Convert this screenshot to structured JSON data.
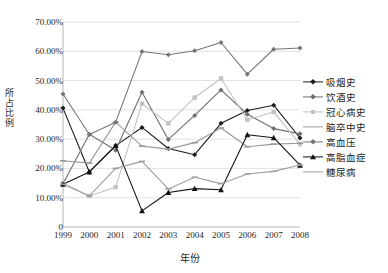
{
  "chart_data": {
    "type": "line",
    "title": "",
    "xlabel": "年份",
    "ylabel": "所占比例",
    "x": [
      1999,
      2000,
      2001,
      2002,
      2003,
      2004,
      2005,
      2006,
      2007,
      2008
    ],
    "xtick_labels": [
      "1999",
      "2000",
      "2001",
      "2002",
      "2003",
      "2004",
      "2005",
      "2006",
      "2007",
      "2008"
    ],
    "ytick_labels": [
      "0",
      "10.00%",
      "20.00%",
      "30.00%",
      "40.00%",
      "50.00%",
      "60.00%",
      "70.00%"
    ],
    "ytick_values": [
      0,
      10,
      20,
      30,
      40,
      50,
      60,
      70
    ],
    "ylim": [
      0,
      70
    ],
    "yunit": "%",
    "grid": "horizontal",
    "legend_position": "right",
    "series": [
      {
        "name": "吸烟史",
        "color": "#1c1c1c",
        "marker": "diamond",
        "values": [
          40.6,
          18.8,
          27.8,
          34.0,
          26.8,
          24.7,
          35.4,
          39.8,
          41.6,
          30.4
        ]
      },
      {
        "name": "饮酒史",
        "color": "#6e6e6e",
        "marker": "diamond",
        "values": [
          14.8,
          31.7,
          26.2,
          46.0,
          29.9,
          38.1,
          46.8,
          38.5,
          33.6,
          31.8
        ]
      },
      {
        "name": "冠心病史",
        "color": "#c2c2c2",
        "marker": "square",
        "values": [
          15.0,
          10.6,
          13.6,
          42.1,
          35.4,
          44.2,
          50.7,
          36.6,
          39.3,
          28.3
        ]
      },
      {
        "name": "脑卒中史",
        "color": "#9a9a9a",
        "marker": "dash",
        "values": [
          22.6,
          21.8,
          35.8,
          27.6,
          26.6,
          28.8,
          33.8,
          27.4,
          28.3,
          28.6
        ]
      },
      {
        "name": "高血压",
        "color": "#767676",
        "marker": "diamond",
        "values": [
          45.4,
          31.6,
          35.8,
          59.9,
          58.8,
          60.2,
          63.0,
          52.2,
          60.7,
          61.1
        ]
      },
      {
        "name": "高脂血症",
        "color": "#111111",
        "marker": "triangle",
        "values": [
          14.6,
          18.8,
          27.8,
          5.5,
          11.8,
          13.1,
          12.7,
          31.5,
          30.5,
          21.1
        ]
      },
      {
        "name": "糖尿病",
        "color": "#9e9e9e",
        "marker": "dash",
        "values": [
          14.6,
          10.6,
          20.0,
          22.4,
          13.0,
          17.0,
          14.8,
          18.1,
          19.0,
          21.2
        ]
      }
    ]
  },
  "legend": {
    "items": [
      {
        "label": "吸烟史"
      },
      {
        "label": "饮酒史"
      },
      {
        "label": "冠心病史"
      },
      {
        "label": "脑卒中史"
      },
      {
        "label": "高血压"
      },
      {
        "label": "高脂血症"
      },
      {
        "label": "糖尿病"
      }
    ]
  },
  "axes": {
    "y_title_chars": [
      "所",
      "占",
      "比",
      "例"
    ],
    "x_title": "年份"
  }
}
